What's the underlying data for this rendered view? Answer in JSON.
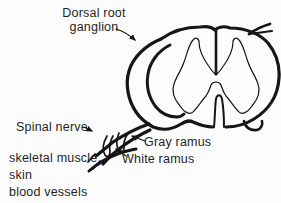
{
  "figure": {
    "background": "#fcfcfc",
    "line_color": "#161616",
    "text_color": "#1f1f1f",
    "labels": {
      "dorsal_root_ganglion": {
        "line1": "Dorsal root",
        "line2": "ganglion"
      },
      "spinal_nerve": "Spinal nerve",
      "gray_ramus": "Gray ramus",
      "white_ramus": "White ramus",
      "targets": [
        "skeletal muscle",
        "skin",
        "blood vessels"
      ]
    }
  }
}
